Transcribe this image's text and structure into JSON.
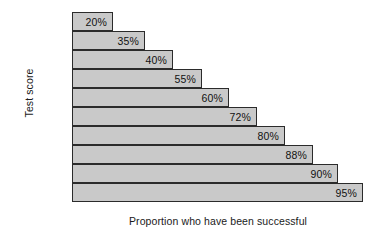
{
  "chart_data": {
    "type": "bar",
    "orientation": "horizontal",
    "title": "",
    "xlabel": "Proportion who have been successful",
    "ylabel": "Test score",
    "categories": [
      "1–5",
      "6–10",
      "11–15",
      "16–20",
      "21–25",
      "26–30",
      "31–35",
      "36–40",
      "41–45",
      "46–50"
    ],
    "values": [
      20,
      35,
      40,
      55,
      60,
      72,
      80,
      88,
      90,
      95
    ],
    "value_labels": [
      "20%",
      "35%",
      "40%",
      "55%",
      "60%",
      "72%",
      "80%",
      "88%",
      "90%",
      "95%"
    ],
    "unit": "%",
    "xlim": [
      0,
      100
    ],
    "grid": false,
    "legend": null,
    "bar_fill_color": "#c9c9c9",
    "bar_border_color": "#2b2b2b",
    "bars": [
      {
        "category": "1–5",
        "value": 20,
        "label": "20%",
        "top": 12,
        "width": 41
      },
      {
        "category": "6–10",
        "value": 35,
        "label": "35%",
        "top": 31,
        "width": 73
      },
      {
        "category": "11–15",
        "value": 40,
        "label": "40%",
        "top": 50,
        "width": 101
      },
      {
        "category": "16–20",
        "value": 55,
        "label": "55%",
        "top": 69,
        "width": 130
      },
      {
        "category": "21–25",
        "value": 60,
        "label": "60%",
        "top": 88,
        "width": 157
      },
      {
        "category": "26–30",
        "value": 72,
        "label": "72%",
        "top": 107,
        "width": 185
      },
      {
        "category": "31–35",
        "value": 80,
        "label": "80%",
        "top": 126,
        "width": 213
      },
      {
        "category": "36–40",
        "value": 88,
        "label": "88%",
        "top": 145,
        "width": 241
      },
      {
        "category": "41–45",
        "value": 90,
        "label": "90%",
        "top": 164,
        "width": 266
      },
      {
        "category": "46–50",
        "value": 95,
        "label": "95%",
        "top": 183,
        "width": 291
      }
    ]
  }
}
